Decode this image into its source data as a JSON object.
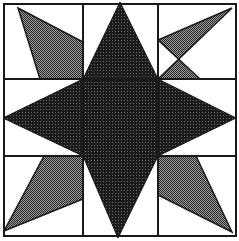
{
  "diagram": {
    "title": "Star quilt block",
    "colors": {
      "background": "#ffffff",
      "line": "#1a1a1a",
      "star_fill": "#1c1c1c",
      "star_dot": "#5a5a5a",
      "kite_fill": "#8a8a8a",
      "kite_dot": "#2a2a2a"
    },
    "grid": {
      "outer": [
        4,
        4,
        236,
        236
      ],
      "vertical_lines": [
        83,
        158
      ],
      "horizontal_lines": [
        79,
        156
      ]
    },
    "star": {
      "label": "center star",
      "points": "120,2 158,79 236,118 158,156 118,238 83,156 3,118 83,79"
    },
    "kites": [
      {
        "label": "top-left kite",
        "points": "18,8 83,42 83,79 40,79"
      },
      {
        "label": "top-right kite",
        "points": "232,8 158,79 200,79 158,40"
      },
      {
        "label": "bottom-left kite",
        "points": "4,231 44,156 83,156 83,199"
      },
      {
        "label": "bottom-right kite",
        "points": "232,232 196,156 158,156 158,195"
      }
    ]
  }
}
